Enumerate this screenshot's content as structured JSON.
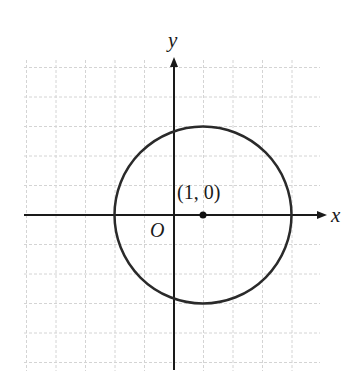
{
  "figure": {
    "type": "coordinate-plane",
    "axes": {
      "x_label": "x",
      "y_label": "y",
      "origin_label": "O"
    },
    "grid": {
      "x_min": -5,
      "x_max": 5,
      "y_min": -5,
      "y_max": 5,
      "spacing": 1,
      "style": "dashed-light"
    },
    "circle": {
      "center": [
        1,
        0
      ],
      "radius": 3,
      "equation": "(x-1)^2 + y^2 = 9"
    },
    "point": {
      "coords": [
        1,
        0
      ],
      "label": "(1, 0)"
    }
  },
  "colors": {
    "grid": "#d4d4d4",
    "axis": "#1a1a1a",
    "curve": "#2a2a2a"
  }
}
